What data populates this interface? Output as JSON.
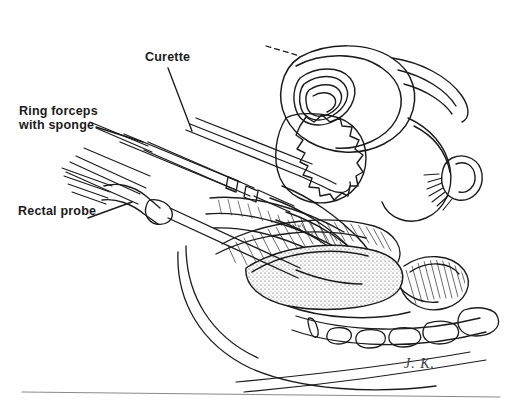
{
  "figure": {
    "kind": "medical-line-illustration",
    "view": "midsagittal-female-pelvis",
    "background_color": "#ffffff",
    "ink_color": "#1b1b1b",
    "signature": "J. K."
  },
  "labels": [
    {
      "id": "curette",
      "text": "Curette",
      "lines": [
        "Curette"
      ],
      "x": 145,
      "y": 51,
      "leader": {
        "from_x": 168,
        "from_y": 68,
        "to_x": 192,
        "to_y": 131
      }
    },
    {
      "id": "ring-forceps",
      "text": "Ring forceps with sponge",
      "lines": [
        "Ring forceps",
        "with sponge"
      ],
      "x": 19,
      "y": 105,
      "leader": {
        "from_x": 96,
        "from_y": 127,
        "to_x": 143,
        "to_y": 142
      }
    },
    {
      "id": "rectal-probe",
      "text": "Rectal probe",
      "lines": [
        "Rectal probe"
      ],
      "x": 18,
      "y": 205,
      "leader": {
        "from_x": 88,
        "from_y": 218,
        "to_x": 132,
        "to_y": 202
      }
    }
  ],
  "anatomy_parts": [
    "uterine-fundus",
    "endometrial-cavity",
    "bladder",
    "fallopian-tube",
    "ovary-fimbriae",
    "cervix",
    "vagina",
    "rectum",
    "anal-canal",
    "sacrum",
    "coccygeal-vertebrae",
    "pelvic-floor-muscle",
    "abdominal-wall"
  ],
  "instruments": [
    "curette",
    "ring-forceps-with-sponge",
    "rectal-probe"
  ],
  "footer": {
    "rule_visible": true,
    "rule_from_x": 22,
    "rule_to_x": 500,
    "rule_y": 394
  }
}
